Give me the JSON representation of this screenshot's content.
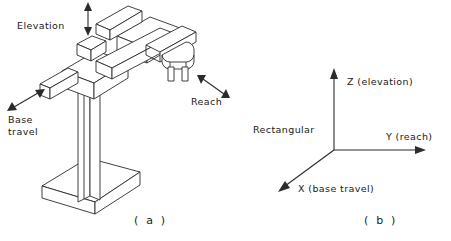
{
  "figure": {
    "panel_a": {
      "caption": "( a )",
      "motion_labels": [
        {
          "name": "elevation",
          "text": "Elevation"
        },
        {
          "name": "reach",
          "text": "Reach"
        },
        {
          "name": "base-travel",
          "line1": "Base",
          "line2": "travel"
        }
      ]
    },
    "panel_b": {
      "caption": "( b )",
      "coordinate_system": "Rectangular",
      "axes": [
        {
          "name": "z-axis",
          "label": "Z (elevation)"
        },
        {
          "name": "y-axis",
          "label": "Y (reach)"
        },
        {
          "name": "x-axis",
          "label": "X (base travel)"
        }
      ]
    }
  },
  "colors": {
    "line": "#2b2b2b",
    "text": "#1a1a1a",
    "background": "#ffffff"
  }
}
